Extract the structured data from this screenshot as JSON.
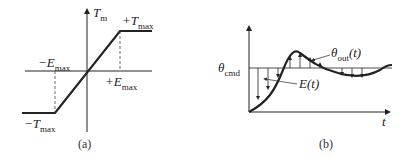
{
  "panel_a": {
    "caption": "(a)",
    "y_axis_label": "T",
    "y_axis_sub": "m",
    "plus_tmax": "+T",
    "minus_tmax": "−T",
    "plus_emax": "+E",
    "minus_emax": "−E",
    "max_sub": "max"
  },
  "panel_b": {
    "caption": "(b)",
    "theta_cmd": "θ",
    "theta_cmd_sub": "cmd",
    "theta_out": "θ",
    "theta_out_sub": "out",
    "theta_out_arg": "(t)",
    "error_label": "E(t)",
    "x_axis_label": "t"
  }
}
